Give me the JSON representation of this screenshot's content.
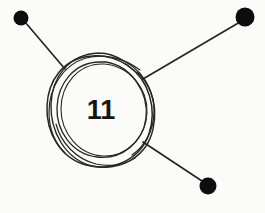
{
  "canvas": {
    "width": 265,
    "height": 213,
    "background_color": "#fbfbfa",
    "ink_color": "#262626",
    "dot_color": "#0d0d0d",
    "label_color": "#141414"
  },
  "diagram": {
    "type": "node-link-sketch",
    "title": "",
    "central_node": {
      "label": "11",
      "shape": "hand-drawn-double-circle",
      "center_x": 100,
      "center_y": 110,
      "radius_outer": 54,
      "radius_inner": 46,
      "label_x": 101,
      "label_y": 119,
      "label_font_size": 27
    },
    "edges": [
      {
        "name": "edge-to-node-top-left",
        "from_x": 65,
        "from_y": 69,
        "to_x": 25,
        "to_y": 22,
        "stroke_width": 1.7
      },
      {
        "name": "edge-to-node-top-right",
        "from_x": 143,
        "from_y": 79,
        "to_x": 240,
        "to_y": 22,
        "stroke_width": 1.7
      },
      {
        "name": "edge-to-node-bottom-right",
        "from_x": 143,
        "from_y": 142,
        "to_x": 205,
        "to_y": 183,
        "stroke_width": 1.7
      }
    ],
    "leaf_nodes": [
      {
        "name": "node-top-left",
        "label": "",
        "cx": 21,
        "cy": 18,
        "r": 7.5,
        "color": "#0d0d0d"
      },
      {
        "name": "node-top-right",
        "label": "",
        "cx": 245,
        "cy": 17,
        "r": 9.5,
        "color": "#0d0d0d"
      },
      {
        "name": "node-bottom-right",
        "label": "",
        "cx": 208,
        "cy": 186,
        "r": 8.5,
        "color": "#0d0d0d"
      }
    ]
  }
}
